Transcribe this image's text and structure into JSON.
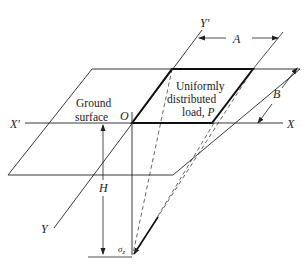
{
  "diagram": {
    "labels": {
      "y_prime": "Y′",
      "y": "Y",
      "x_prime": "X′",
      "x": "X",
      "origin": "O",
      "dim_a": "A",
      "dim_b": "B",
      "depth_h": "H",
      "stress_sigma": "σ",
      "stress_sub": "z",
      "ground_line1": "Ground",
      "ground_line2": "surface",
      "load_line1": "Uniformly",
      "load_line2": "distributed",
      "load_line3": "load, ",
      "load_p": "P"
    },
    "colors": {
      "line": "#222222",
      "background": "#ffffff"
    }
  }
}
